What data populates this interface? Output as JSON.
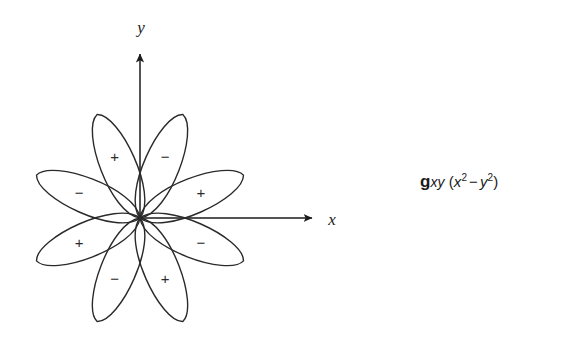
{
  "figure": {
    "type": "orbital-lobe-diagram",
    "title": "",
    "background_color": "#ffffff",
    "stroke_color": "#2a2a2a",
    "axes": {
      "origin": {
        "x": 140,
        "y": 218
      },
      "x_axis": {
        "label": "x",
        "arrow_tip": {
          "x": 318,
          "y": 218
        },
        "label_pos": {
          "x": 332,
          "y": 224
        }
      },
      "y_axis": {
        "label": "y",
        "arrow_tip": {
          "x": 140,
          "y": 48
        },
        "label_pos": {
          "x": 140,
          "y": 32
        }
      }
    },
    "lobes": [
      {
        "name": "lobe-upper-right-outer",
        "angle_deg": 22.5,
        "sign": "+",
        "label_radius": 66
      },
      {
        "name": "lobe-upper-right-inner",
        "angle_deg": 67.5,
        "sign": "−",
        "label_radius": 66
      },
      {
        "name": "lobe-upper-left-inner",
        "angle_deg": 112.5,
        "sign": "+",
        "label_radius": 66
      },
      {
        "name": "lobe-upper-left-outer",
        "angle_deg": 157.5,
        "sign": "−",
        "label_radius": 66
      },
      {
        "name": "lobe-lower-left-outer",
        "angle_deg": 202.5,
        "sign": "+",
        "label_radius": 66
      },
      {
        "name": "lobe-lower-left-inner",
        "angle_deg": 247.5,
        "sign": "−",
        "label_radius": 66
      },
      {
        "name": "lobe-lower-right-inner",
        "angle_deg": 292.5,
        "sign": "+",
        "label_radius": 66
      },
      {
        "name": "lobe-lower-right-outer",
        "angle_deg": 337.5,
        "sign": "−",
        "label_radius": 66
      }
    ],
    "lobe_geometry": {
      "length": 112,
      "half_width": 26,
      "count": 8
    }
  },
  "caption": {
    "symbol": "g",
    "subscript": "xy",
    "expression_open": "(",
    "term1_var": "x",
    "term1_exp": "2",
    "operator": "−",
    "term2_var": "y",
    "term2_exp": "2",
    "expression_close": ")",
    "full_text": "gₓᵧ (x² − y²)"
  }
}
